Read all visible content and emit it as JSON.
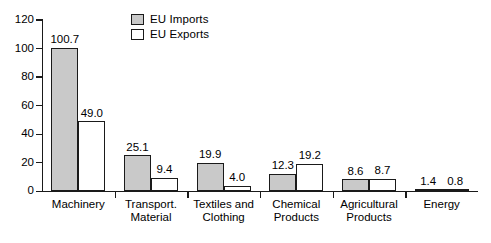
{
  "chart_data": {
    "type": "bar",
    "title": "",
    "subtitle": "",
    "xlabel": "",
    "ylabel": "",
    "ylim": [
      0,
      120
    ],
    "ytick_values": [
      0,
      20,
      40,
      60,
      80,
      100,
      120
    ],
    "ytick_labels": [
      "0",
      "20",
      "40",
      "60",
      "80",
      "100",
      "120"
    ],
    "grid": false,
    "legend_position": "top-center",
    "categories": [
      "Machinery",
      "Transport.\nMaterial",
      "Textiles and\nClothing",
      "Chemical\nProducts",
      "Agricultural\nProducts",
      "Energy"
    ],
    "series": [
      {
        "name": "EU Imports",
        "color": "#c9c9c9",
        "edge_color": "#1a1a1a",
        "values": [
          100.7,
          25.1,
          19.9,
          12.3,
          8.6,
          1.4
        ],
        "labels": [
          "100.7",
          "25.1",
          "19.9",
          "12.3",
          "8.6",
          "1.4"
        ]
      },
      {
        "name": "EU Exports",
        "color": "#ffffff",
        "edge_color": "#1a1a1a",
        "values": [
          49.0,
          9.4,
          4.0,
          19.2,
          8.7,
          0.8
        ],
        "labels": [
          "49.0",
          "9.4",
          "4.0",
          "19.2",
          "8.7",
          "0.8"
        ]
      }
    ]
  },
  "legend": {
    "items": [
      {
        "label": "EU Imports",
        "swatch": "#c9c9c9"
      },
      {
        "label": "EU Exports",
        "swatch": "#ffffff"
      }
    ]
  }
}
